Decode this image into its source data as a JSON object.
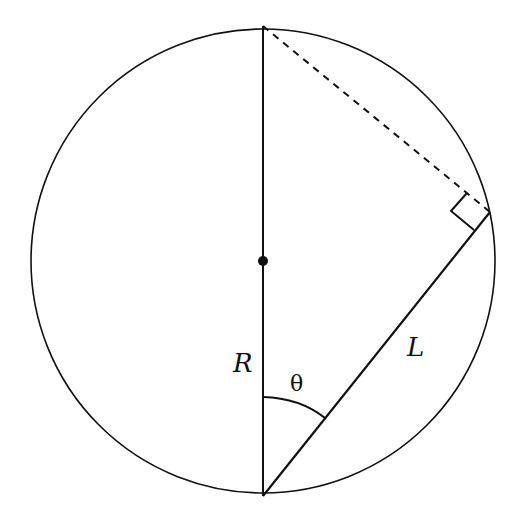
{
  "diagram": {
    "type": "geometry",
    "labels": {
      "radius": "R",
      "angle": "θ",
      "chord": "L"
    },
    "elements": {
      "circle": {
        "cx": 263,
        "cy": 261,
        "r": 232
      },
      "center_point": {
        "x": 263,
        "y": 261
      },
      "diameter": {
        "x1": 263,
        "y1": 26,
        "x2": 263,
        "y2": 496
      },
      "chord": {
        "x1": 263,
        "y1": 496,
        "x2": 490,
        "y2": 212
      },
      "dashed_line": {
        "x1": 263,
        "y1": 26,
        "x2": 490,
        "y2": 212
      },
      "right_angle_marker_at": {
        "x": 490,
        "y": 212
      },
      "angle_arc": {
        "from_x": 263,
        "from_y": 397,
        "to_x": 325,
        "to_y": 418
      }
    },
    "colors": {
      "stroke": "#111111",
      "background": "#ffffff"
    }
  }
}
